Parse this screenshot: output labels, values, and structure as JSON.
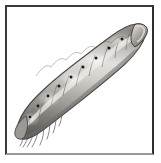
{
  "figure": {
    "domain_kind": "natural-image-illustration",
    "subject_name": "caterpillar",
    "subject_alt_name": "larva",
    "style": "greyscale stippled scientific illustration",
    "background_color": "#ffffff",
    "frame": {
      "name": "plate-frame",
      "outer_left": 5,
      "outer_top": 5,
      "width": 149,
      "height": 150,
      "border_top_color": "#3a3a3c",
      "border_left_color": "#3a3a3c",
      "border_right_color": "#2e2e30",
      "border_bottom_color": "#9a9a9c",
      "border_width_px": 2
    },
    "palette": {
      "body_highlight": "#e6e4e1",
      "body_midtone": "#b4b1ad",
      "body_shadow": "#85827e",
      "body_deep_shadow": "#5f5d5a",
      "outline": "#4a4846",
      "spiracle_dot": "#1c1b1a",
      "leg_grey": "#8d8a86",
      "paper": "#ffffff"
    },
    "subject": {
      "orientation": "diagonal, head at upper-right, tail at lower-left",
      "head_position": [
        139,
        35
      ],
      "tail_position": [
        26,
        134
      ],
      "body_length_px": 148,
      "body_width_px": 20,
      "segment_count": 11,
      "spiracle_dots": [
        [
          121,
          40
        ],
        [
          108,
          49
        ],
        [
          95,
          58
        ],
        [
          82,
          67
        ],
        [
          70,
          76
        ],
        [
          58,
          85
        ],
        [
          47,
          94
        ],
        [
          37,
          104
        ],
        [
          30,
          115
        ]
      ],
      "proleg_count": 5,
      "prolegs": [
        [
          110,
          68
        ],
        [
          95,
          80
        ],
        [
          79,
          92
        ],
        [
          62,
          104
        ],
        [
          46,
          117
        ]
      ],
      "seta_count": 8
    }
  },
  "caption": {
    "visible": false,
    "text": ""
  }
}
